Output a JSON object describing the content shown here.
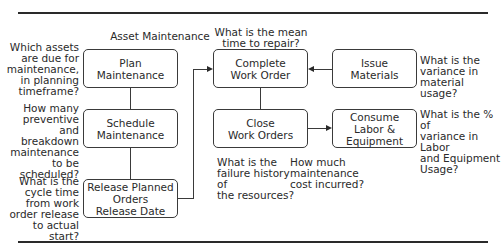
{
  "diagram": {
    "title": "Asset Maintenance",
    "boxes": {
      "plan": "Plan\nMaintenance",
      "schedule": "Schedule\nMaintenance",
      "release": "Release Planned\nOrders\nRelease Date",
      "complete": "Complete\nWork Order",
      "close": "Close\nWork Orders",
      "issue": "Issue\nMaterials",
      "consume": "Consume\nLabor &\nEquipment"
    },
    "questions": {
      "plan": "Which assets\nare due for\nmaintenance,\nin planning\ntimeframe?",
      "schedule": "How many\npreventive and\nbreakdown\nmaintenance\nto be\nscheduled?",
      "release": "What is the\ncycle time\nfrom work\norder release\nto actual start?",
      "complete": "What is the mean\ntime to repair?",
      "issue": "What is the\nvariance in\nmaterial usage?",
      "consume": "What is the % of\nvariance in Labor\nand Equipment\nUsage?",
      "close_failure": "What is the\nfailure history of\nthe resources?",
      "close_cost": "How much\nmaintenance\ncost incurred?"
    },
    "colors": {
      "line": "#2a2a2a",
      "background": "#ffffff"
    }
  }
}
